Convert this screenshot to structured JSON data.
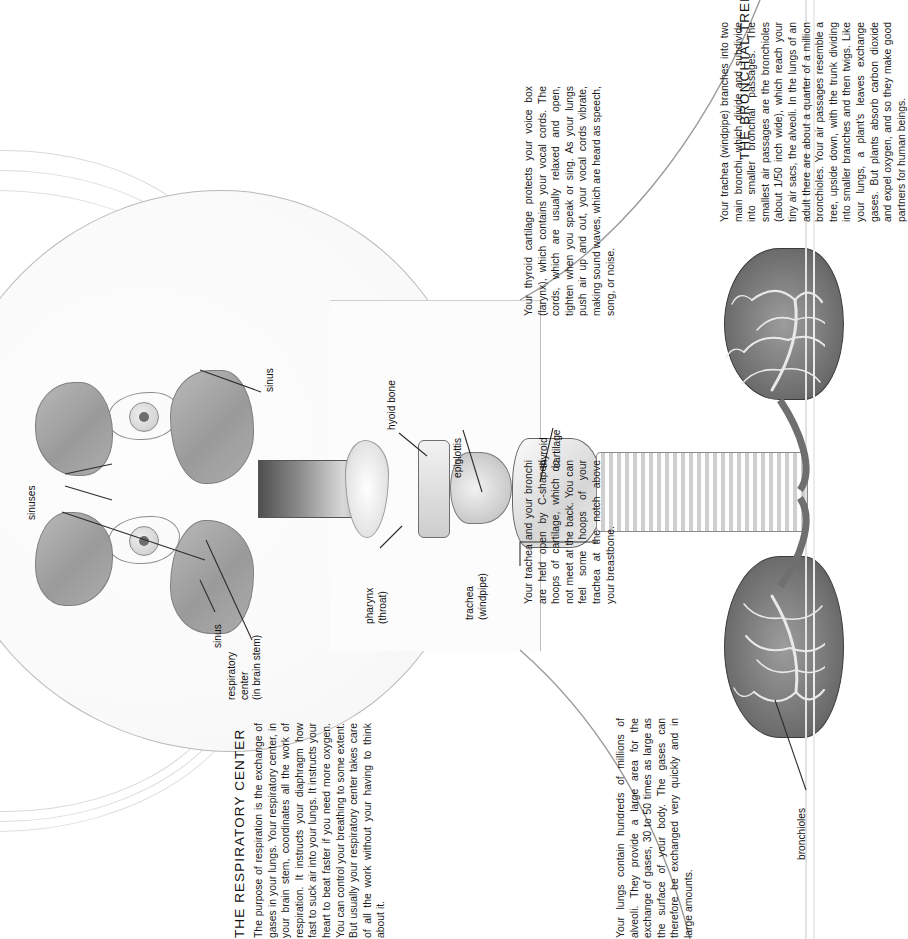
{
  "page": {
    "background_color": "#ffffff",
    "text_color": "#1a1a1a",
    "orientation": "rotated-90-ccw"
  },
  "sections": [
    {
      "id": "bronchial-tree",
      "heading": "THE BRONCHIAL TREE",
      "paragraphs": [
        "Your trachea (windpipe) branches into two main bronchi, which divide and subdivide into smaller bronchial passages. The smallest air passages are the bronchioles (about 1/50 inch wide), which reach your tiny air sacs, the alveoli. In the lungs of an adult there are about a quarter of a million bronchioles. Your air passages resemble a tree, upside down, with the trunk dividing into smaller branches and then twigs. Like your lungs, a plant's leaves exchange gases. But plants absorb carbon dioxide and expel oxygen, and so they make good partners for human beings."
      ]
    },
    {
      "id": "voice-box",
      "heading": "",
      "paragraphs": [
        "Your thyroid cartilage protects your voice box (larynx), which contains your vocal cords. The cords, which are usually relaxed and open, tighten when you speak or sing. As your lungs push air up and out, your vocal cords vibrate, making sound waves, which are heard as speech, song, or noise."
      ]
    },
    {
      "id": "trachea-cartilage",
      "heading": "",
      "paragraphs": [
        "Your trachea and your bronchi are held open by C-shaped hoops of cartilage, which do not meet at the back. You can feel some hoops of your trachea at the notch above your breastbone."
      ]
    },
    {
      "id": "respiratory-center",
      "heading": "THE RESPIRATORY CENTER",
      "paragraphs": [
        "The purpose of respiration is the exchange of gases in your lungs. Your respiratory center, in your brain stem, coordinates all the work of respiration. It instructs your diaphragm how fast to suck air into your lungs. It instructs your heart to beat faster if you need more oxygen. You can control your breathing to some extent. But usually your respiratory center takes care of all the work without your having to think about it."
      ]
    },
    {
      "id": "alveoli",
      "heading": "",
      "paragraphs": [
        "Your lungs contain hundreds of millions of alveoli. They provide a large area for the exchange of gases, 30 to 50 times as large as the surface of your body. The gases can therefore be exchanged very quickly and in large amounts."
      ]
    }
  ],
  "labels": [
    {
      "id": "sinus-upper",
      "text": "sinus"
    },
    {
      "id": "sinuses",
      "text": "sinuses"
    },
    {
      "id": "sinus-lower",
      "text": "sinus"
    },
    {
      "id": "respiratory-center",
      "text": "respiratory\ncenter\n(in brain stem)",
      "lines": [
        "respiratory",
        "center",
        "(in brain stem)"
      ]
    },
    {
      "id": "pharynx",
      "text": "pharynx\n(throat)",
      "lines": [
        "pharynx",
        "(throat)"
      ]
    },
    {
      "id": "hyoid-bone",
      "text": "hyoid bone"
    },
    {
      "id": "epiglottis",
      "text": "epiglottis"
    },
    {
      "id": "thyroid-cartilage",
      "text": "thyroid\ncartilage",
      "lines": [
        "thyroid",
        "cartilage"
      ]
    },
    {
      "id": "trachea",
      "text": "trachea\n(windpipe)",
      "lines": [
        "trachea",
        "(windpipe)"
      ]
    },
    {
      "id": "bronchioles",
      "text": "bronchioles"
    }
  ],
  "illustration": {
    "subject": "mid-sagittal human head and neck with upper respiratory tract and lungs",
    "parts": [
      "sinus",
      "sinuses",
      "eye",
      "tongue",
      "pharynx",
      "hyoid bone",
      "epiglottis",
      "thyroid cartilage",
      "trachea",
      "bronchi",
      "bronchioles",
      "lung"
    ]
  }
}
